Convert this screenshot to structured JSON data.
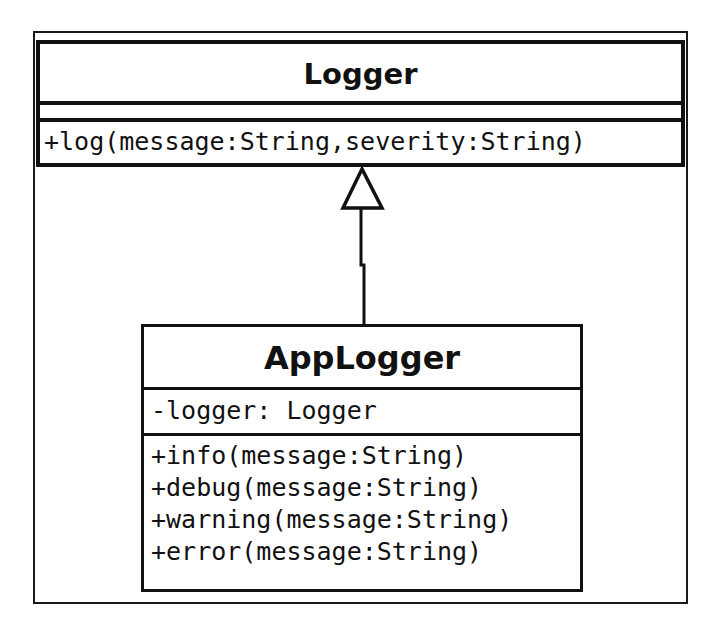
{
  "diagram": {
    "type": "uml-class-diagram",
    "classes": [
      {
        "id": "logger",
        "name": "Logger",
        "attributes": [],
        "operations": [
          "+log(message:String,severity:String)"
        ]
      },
      {
        "id": "applogger",
        "name": "AppLogger",
        "attributes": [
          "-logger: Logger"
        ],
        "operations": [
          "+info(message:String)",
          "+debug(message:String)",
          "+warning(message:String)",
          "+error(message:String)"
        ]
      }
    ],
    "relationships": [
      {
        "type": "generalization",
        "from": "AppLogger",
        "to": "Logger",
        "arrowhead": "hollow-triangle"
      }
    ]
  },
  "colors": {
    "line": "#111111",
    "background": "#ffffff"
  }
}
